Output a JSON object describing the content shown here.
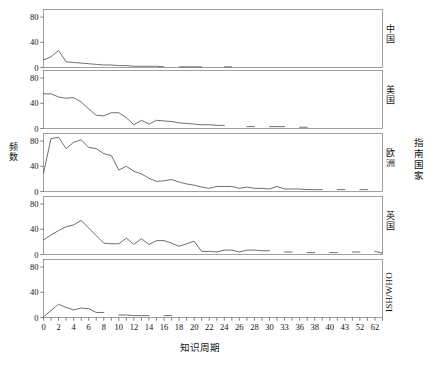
{
  "chart_data": {
    "type": "line",
    "title": "",
    "xlabel": "知识周期",
    "ylabel": "频数",
    "group_label": "指南国家",
    "layout": "faceted-rows",
    "grid": false,
    "legend": "none",
    "ylim": [
      0,
      92
    ],
    "yticks": [
      0,
      40,
      80
    ],
    "ytick_labels": [
      "0",
      "40",
      "80"
    ],
    "xtick_labels": [
      "0",
      "2",
      "4",
      "6",
      "8",
      "10",
      "12",
      "14",
      "16",
      "18",
      "20",
      "22",
      "24",
      "26",
      "28",
      "30",
      "33",
      "36",
      "38",
      "40",
      "43",
      "52",
      "62",
      "68"
    ],
    "x_positions": [
      0,
      1,
      2,
      3,
      4,
      5,
      6,
      7,
      8,
      9,
      10,
      11,
      12,
      13,
      14,
      15,
      16,
      17,
      18,
      19,
      20,
      21,
      22,
      23,
      24,
      25,
      26,
      27,
      28,
      29,
      30,
      31,
      32,
      33,
      34,
      35,
      36,
      37,
      38,
      39,
      40,
      41,
      42,
      43,
      44,
      45
    ],
    "x_axis_note": "index positions; tick labels shown every other index, non-uniform values at tail (30,33,36,38,40,43,52,62,68)",
    "panels": [
      {
        "label": "中国",
        "label_script": "cjk",
        "points": [
          {
            "x": 0,
            "y": 12
          },
          {
            "x": 1,
            "y": 17
          },
          {
            "x": 2,
            "y": 27
          },
          {
            "x": 3,
            "y": 9
          },
          {
            "x": 4,
            "y": 8
          },
          {
            "x": 5,
            "y": 7
          },
          {
            "x": 6,
            "y": 6
          },
          {
            "x": 7,
            "y": 5
          },
          {
            "x": 8,
            "y": 4
          },
          {
            "x": 9,
            "y": 4
          },
          {
            "x": 10,
            "y": 3
          },
          {
            "x": 11,
            "y": 3
          },
          {
            "x": 12,
            "y": 2
          },
          {
            "x": 13,
            "y": 2
          },
          {
            "x": 14,
            "y": 2
          },
          {
            "x": 15,
            "y": 2
          },
          {
            "x": 16,
            "y": 1
          },
          {
            "x": 18,
            "y": 1
          },
          {
            "x": 19,
            "y": 1
          },
          {
            "x": 20,
            "y": 1
          },
          {
            "x": 21,
            "y": 1
          },
          {
            "x": 24,
            "y": 1
          },
          {
            "x": 25,
            "y": 1
          }
        ]
      },
      {
        "label": "美国",
        "label_script": "cjk",
        "points": [
          {
            "x": 0,
            "y": 55
          },
          {
            "x": 1,
            "y": 55
          },
          {
            "x": 2,
            "y": 50
          },
          {
            "x": 3,
            "y": 48
          },
          {
            "x": 4,
            "y": 49
          },
          {
            "x": 5,
            "y": 42
          },
          {
            "x": 6,
            "y": 31
          },
          {
            "x": 7,
            "y": 21
          },
          {
            "x": 8,
            "y": 20
          },
          {
            "x": 9,
            "y": 25
          },
          {
            "x": 10,
            "y": 25
          },
          {
            "x": 11,
            "y": 17
          },
          {
            "x": 12,
            "y": 6
          },
          {
            "x": 13,
            "y": 13
          },
          {
            "x": 14,
            "y": 7
          },
          {
            "x": 15,
            "y": 13
          },
          {
            "x": 16,
            "y": 12
          },
          {
            "x": 17,
            "y": 11
          },
          {
            "x": 18,
            "y": 9
          },
          {
            "x": 19,
            "y": 8
          },
          {
            "x": 20,
            "y": 7
          },
          {
            "x": 21,
            "y": 6
          },
          {
            "x": 22,
            "y": 6
          },
          {
            "x": 23,
            "y": 5
          },
          {
            "x": 24,
            "y": 5
          },
          {
            "x": 27,
            "y": 3
          },
          {
            "x": 28,
            "y": 3
          },
          {
            "x": 30,
            "y": 3
          },
          {
            "x": 31,
            "y": 3
          },
          {
            "x": 32,
            "y": 3
          },
          {
            "x": 34,
            "y": 2
          },
          {
            "x": 35,
            "y": 2
          },
          {
            "x": 37,
            "y": 2
          }
        ]
      },
      {
        "label": "欧洲",
        "label_script": "cjk",
        "points": [
          {
            "x": 0,
            "y": 29
          },
          {
            "x": 1,
            "y": 84
          },
          {
            "x": 2,
            "y": 86
          },
          {
            "x": 3,
            "y": 68
          },
          {
            "x": 4,
            "y": 78
          },
          {
            "x": 5,
            "y": 82
          },
          {
            "x": 6,
            "y": 70
          },
          {
            "x": 7,
            "y": 68
          },
          {
            "x": 8,
            "y": 60
          },
          {
            "x": 9,
            "y": 57
          },
          {
            "x": 10,
            "y": 34
          },
          {
            "x": 11,
            "y": 40
          },
          {
            "x": 12,
            "y": 32
          },
          {
            "x": 13,
            "y": 28
          },
          {
            "x": 14,
            "y": 21
          },
          {
            "x": 15,
            "y": 16
          },
          {
            "x": 16,
            "y": 17
          },
          {
            "x": 17,
            "y": 19
          },
          {
            "x": 18,
            "y": 15
          },
          {
            "x": 19,
            "y": 12
          },
          {
            "x": 20,
            "y": 10
          },
          {
            "x": 21,
            "y": 7
          },
          {
            "x": 22,
            "y": 5
          },
          {
            "x": 23,
            "y": 8
          },
          {
            "x": 24,
            "y": 8
          },
          {
            "x": 25,
            "y": 8
          },
          {
            "x": 26,
            "y": 5
          },
          {
            "x": 27,
            "y": 7
          },
          {
            "x": 28,
            "y": 5
          },
          {
            "x": 29,
            "y": 5
          },
          {
            "x": 30,
            "y": 4
          },
          {
            "x": 31,
            "y": 8
          },
          {
            "x": 32,
            "y": 4
          },
          {
            "x": 33,
            "y": 4
          },
          {
            "x": 34,
            "y": 4
          },
          {
            "x": 35,
            "y": 3
          },
          {
            "x": 36,
            "y": 3
          },
          {
            "x": 37,
            "y": 3
          },
          {
            "x": 39,
            "y": 3
          },
          {
            "x": 40,
            "y": 3
          },
          {
            "x": 42,
            "y": 3
          },
          {
            "x": 43,
            "y": 3
          },
          {
            "x": 45,
            "y": 2
          }
        ]
      },
      {
        "label": "英国",
        "label_script": "cjk",
        "points": [
          {
            "x": 0,
            "y": 23
          },
          {
            "x": 1,
            "y": 31
          },
          {
            "x": 2,
            "y": 38
          },
          {
            "x": 3,
            "y": 44
          },
          {
            "x": 4,
            "y": 47
          },
          {
            "x": 5,
            "y": 54
          },
          {
            "x": 6,
            "y": 42
          },
          {
            "x": 7,
            "y": 30
          },
          {
            "x": 8,
            "y": 18
          },
          {
            "x": 9,
            "y": 17
          },
          {
            "x": 10,
            "y": 17
          },
          {
            "x": 11,
            "y": 26
          },
          {
            "x": 12,
            "y": 16
          },
          {
            "x": 13,
            "y": 25
          },
          {
            "x": 14,
            "y": 16
          },
          {
            "x": 15,
            "y": 22
          },
          {
            "x": 16,
            "y": 22
          },
          {
            "x": 17,
            "y": 18
          },
          {
            "x": 18,
            "y": 13
          },
          {
            "x": 19,
            "y": 17
          },
          {
            "x": 20,
            "y": 21
          },
          {
            "x": 21,
            "y": 5
          },
          {
            "x": 22,
            "y": 5
          },
          {
            "x": 23,
            "y": 4
          },
          {
            "x": 24,
            "y": 7
          },
          {
            "x": 25,
            "y": 7
          },
          {
            "x": 26,
            "y": 4
          },
          {
            "x": 27,
            "y": 7
          },
          {
            "x": 28,
            "y": 7
          },
          {
            "x": 29,
            "y": 6
          },
          {
            "x": 30,
            "y": 6
          },
          {
            "x": 32,
            "y": 4
          },
          {
            "x": 33,
            "y": 4
          },
          {
            "x": 35,
            "y": 3
          },
          {
            "x": 36,
            "y": 3
          },
          {
            "x": 38,
            "y": 3
          },
          {
            "x": 39,
            "y": 3
          },
          {
            "x": 41,
            "y": 4
          },
          {
            "x": 42,
            "y": 4
          },
          {
            "x": 44,
            "y": 5
          },
          {
            "x": 45,
            "y": 2
          }
        ]
      },
      {
        "label": "ISH/WHO",
        "label_script": "latin",
        "points": [
          {
            "x": 0,
            "y": 1
          },
          {
            "x": 1,
            "y": 11
          },
          {
            "x": 2,
            "y": 21
          },
          {
            "x": 3,
            "y": 16
          },
          {
            "x": 4,
            "y": 12
          },
          {
            "x": 5,
            "y": 15
          },
          {
            "x": 6,
            "y": 14
          },
          {
            "x": 7,
            "y": 8
          },
          {
            "x": 8,
            "y": 8
          },
          {
            "x": 10,
            "y": 4
          },
          {
            "x": 11,
            "y": 4
          },
          {
            "x": 12,
            "y": 3
          },
          {
            "x": 13,
            "y": 3
          },
          {
            "x": 14,
            "y": 3
          },
          {
            "x": 16,
            "y": 3
          },
          {
            "x": 17,
            "y": 3
          }
        ]
      }
    ]
  }
}
